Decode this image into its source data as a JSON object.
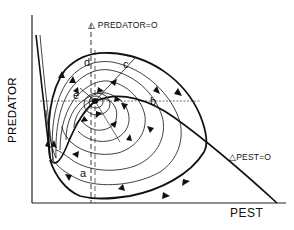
{
  "diagram": {
    "type": "phase-plane",
    "axes": {
      "x_label": "PEST",
      "y_label": "PREDATOR"
    },
    "isoclines": {
      "predator": {
        "label": "△ PREDATOR=O",
        "style": "dashed-vertical"
      },
      "pest": {
        "label": "△PEST=O",
        "style": "hump-curve"
      }
    },
    "point_labels": {
      "a": "a",
      "b": "b",
      "c": "c",
      "d": "d",
      "e": "e"
    },
    "colors": {
      "ink": "#111111",
      "background": "#ffffff"
    }
  }
}
